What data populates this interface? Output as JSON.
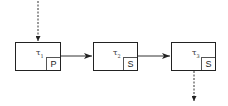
{
  "diagram": {
    "tasks": [
      {
        "symbol": "τ",
        "index": "1",
        "tag": "P"
      },
      {
        "symbol": "τ",
        "index": "2",
        "tag": "S"
      },
      {
        "symbol": "τ",
        "index": "3",
        "tag": "S"
      }
    ],
    "edges": [
      {
        "from": "external-input",
        "to": "task-1",
        "style": "dashed"
      },
      {
        "from": "task-1",
        "to": "task-2",
        "style": "solid"
      },
      {
        "from": "task-2",
        "to": "task-3",
        "style": "solid"
      },
      {
        "from": "task-3",
        "to": "external-output",
        "style": "dashed"
      }
    ],
    "colors": {
      "line": "#222222",
      "arrow": "#222222"
    }
  }
}
